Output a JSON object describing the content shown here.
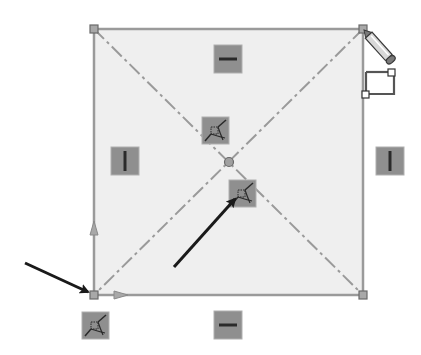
{
  "figure": {
    "width": 421,
    "height": 355
  },
  "colors": {
    "background": "#ffffff",
    "rect_fill": "#efefef",
    "rect_stroke": "#9a9a9a",
    "vertex_fill": "#a8a8a8",
    "vertex_stroke": "#6a6a6a",
    "construction_line": "#9a9a9a",
    "relation_icon_bg": "#8f8f8f",
    "relation_icon_border": "#b0b0b0",
    "relation_glyph": "#2a2a2a",
    "annotation_arrow": "#1a1a1a",
    "pencil_body": "#d8d8d8",
    "pencil_outline": "#3a3a3a"
  },
  "rectangle": {
    "x1": 94,
    "y1": 29,
    "x2": 363,
    "y2": 295
  },
  "center_point": {
    "x": 229,
    "y": 162,
    "label": "midpoint"
  },
  "relations": [
    {
      "type": "horizontal",
      "x": 228,
      "y": 59,
      "label": "Horizontal relation (top edge)"
    },
    {
      "type": "horizontal",
      "x": 228,
      "y": 325,
      "label": "Horizontal relation (bottom edge)"
    },
    {
      "type": "vertical",
      "x": 125,
      "y": 161,
      "label": "Vertical relation (left edge)"
    },
    {
      "type": "vertical",
      "x": 390,
      "y": 161,
      "label": "Vertical relation (right edge)"
    },
    {
      "type": "midpoint",
      "x": 215,
      "y": 130,
      "label": "Midpoint relation"
    },
    {
      "type": "midpoint",
      "x": 242,
      "y": 193,
      "label": "Midpoint relation"
    },
    {
      "type": "midpoint",
      "x": 96,
      "y": 326,
      "label": "Midpoint relation (origin)"
    }
  ],
  "annotations": [
    {
      "from": [
        25,
        263
      ],
      "to": [
        88,
        293
      ],
      "label": "arrow to origin vertex"
    },
    {
      "from": [
        174,
        267
      ],
      "to": [
        236,
        198
      ],
      "label": "arrow to midpoint relation"
    }
  ],
  "cursor": {
    "type": "pencil-sketch",
    "x": 363,
    "y": 29
  }
}
